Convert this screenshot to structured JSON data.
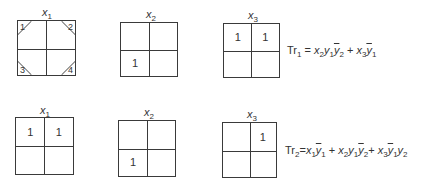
{
  "rows": [
    {
      "maps": [
        {
          "label_var": "x",
          "label_sub": "1",
          "cells": [
            "",
            "",
            "",
            ""
          ],
          "corner_markers": [
            "1",
            "2",
            "3",
            "4"
          ]
        },
        {
          "label_var": "x",
          "label_sub": "2",
          "cells": [
            "",
            "",
            "1",
            ""
          ]
        },
        {
          "label_var": "x",
          "label_sub": "3",
          "cells": [
            "1",
            "1",
            "",
            ""
          ]
        }
      ],
      "formula": {
        "lhs": "Tr",
        "lhs_sub": "1",
        "text": "Tr₁ = x₂y₁ȳ₂ + x₃ȳ₁"
      }
    },
    {
      "maps": [
        {
          "label_var": "x",
          "label_sub": "1",
          "cells": [
            "1",
            "1",
            "",
            ""
          ]
        },
        {
          "label_var": "x",
          "label_sub": "2",
          "cells": [
            "",
            "",
            "1",
            ""
          ]
        },
        {
          "label_var": "x",
          "label_sub": "3",
          "cells": [
            "",
            "1",
            "",
            ""
          ]
        }
      ],
      "formula": {
        "lhs": "Tr",
        "lhs_sub": "2",
        "text": "Tr₂ = x₁ȳ₁ + x₂y₁ȳ₂ + x₃ȳ₁y₂"
      }
    }
  ],
  "plus": "+",
  "equals": "="
}
